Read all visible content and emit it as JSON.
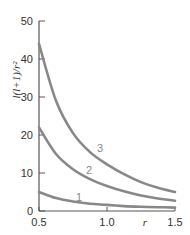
{
  "chart_data": {
    "type": "line",
    "title": "",
    "xlabel": "r",
    "ylabel": "l(l+1)/r²",
    "xlim": [
      0.5,
      1.5
    ],
    "ylim": [
      0,
      50
    ],
    "grid": false,
    "legend": "inline curve labels",
    "x_ticks": [
      "0.5",
      "1.0",
      "1.5"
    ],
    "y_ticks": [
      "0",
      "10",
      "20",
      "30",
      "40",
      "50"
    ],
    "x": [
      0.5,
      0.625,
      0.75,
      0.875,
      1.0,
      1.125,
      1.25,
      1.375,
      1.5
    ],
    "series": [
      {
        "name": "1",
        "values": [
          5.0,
          3.4,
          2.5,
          1.9,
          1.6,
          1.3,
          1.1,
          1.0,
          0.9
        ]
      },
      {
        "name": "2",
        "values": [
          22.0,
          15.0,
          11.0,
          8.4,
          6.6,
          5.2,
          4.1,
          3.3,
          2.7
        ]
      },
      {
        "name": "3",
        "values": [
          44.0,
          29.0,
          20.5,
          15.5,
          12.3,
          9.7,
          7.6,
          6.1,
          5.0
        ]
      }
    ],
    "curve_colors": "#888888"
  },
  "axes": {
    "x_label": "r",
    "y_label": "l(l+1)/r²"
  }
}
